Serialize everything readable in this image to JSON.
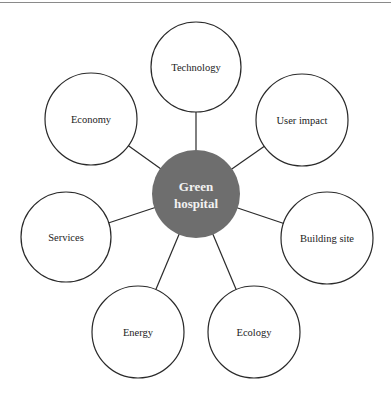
{
  "diagram": {
    "type": "mind-map",
    "hub": {
      "label_line1": "Green",
      "label_line2": "hospital",
      "cx": 196,
      "cy": 194,
      "r": 44,
      "fill": "#6e6e6e",
      "text_color": "#f2f2f2"
    },
    "nodes": [
      {
        "label": "Technology",
        "cx": 196,
        "cy": 67,
        "r": 45
      },
      {
        "label": "User impact",
        "cx": 302,
        "cy": 120,
        "r": 46
      },
      {
        "label": "Building site",
        "cx": 327,
        "cy": 238,
        "r": 46
      },
      {
        "label": "Ecology",
        "cx": 254,
        "cy": 332,
        "r": 46
      },
      {
        "label": "Energy",
        "cx": 138,
        "cy": 332,
        "r": 46
      },
      {
        "label": "Services",
        "cx": 66,
        "cy": 237,
        "r": 45
      },
      {
        "label": "Economy",
        "cx": 91,
        "cy": 119,
        "r": 46
      }
    ],
    "stroke_color": "#2a2a2a"
  }
}
